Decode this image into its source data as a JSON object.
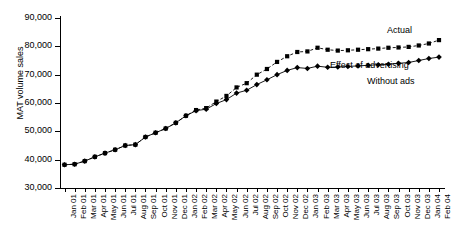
{
  "chart_data": {
    "type": "line",
    "title": "",
    "xlabel": "",
    "ylabel": "MAT volume sales",
    "ylim": [
      30000,
      90000
    ],
    "ytick_labels": [
      "30,000",
      "40,000",
      "50,000",
      "60,000",
      "70,000",
      "80,000",
      "90,000"
    ],
    "ytick_values": [
      30000,
      40000,
      50000,
      60000,
      70000,
      80000,
      90000
    ],
    "grid": false,
    "legend_position": "inline-annotations",
    "categories": [
      "Jan 01",
      "Feb 01",
      "Mar 01",
      "Apr 01",
      "May 01",
      "Jun 01",
      "Jul 01",
      "Aug 01",
      "Sep 01",
      "Oct 01",
      "Nov 01",
      "Dec 01",
      "Jan 02",
      "Feb 02",
      "Mar 02",
      "Apr 02",
      "May 02",
      "Jun 02",
      "Jul 02",
      "Aug 02",
      "Sep 02",
      "Oct 02",
      "Nov 02",
      "Dec 02",
      "Jan 03",
      "Feb 03",
      "Mar 03",
      "Apr 03",
      "May 03",
      "Jun 03",
      "Jul 03",
      "Aug 03",
      "Sep 03",
      "Oct 03",
      "Nov 03",
      "Dec 03",
      "Jan 04",
      "Feb 04"
    ],
    "series": [
      {
        "name": "Actual",
        "marker": "square",
        "line_style": "dashed",
        "color": "#000000",
        "values": [
          38200,
          38400,
          39500,
          41000,
          42300,
          43500,
          45000,
          45300,
          48000,
          49500,
          51000,
          53000,
          55500,
          57500,
          58200,
          60500,
          62500,
          65500,
          67000,
          70000,
          72000,
          74500,
          76500,
          78000,
          78200,
          79500,
          78800,
          78500,
          78600,
          78800,
          79000,
          79200,
          79500,
          79600,
          79800,
          80300,
          81000,
          82200
        ]
      },
      {
        "name": "Without ads",
        "marker": "diamond",
        "line_style": "solid",
        "color": "#000000",
        "values": [
          38200,
          38400,
          39500,
          41000,
          42300,
          43500,
          45000,
          45300,
          48000,
          49500,
          51000,
          53000,
          55500,
          57300,
          57800,
          59800,
          61200,
          63500,
          64500,
          66500,
          68200,
          70000,
          71500,
          72500,
          72200,
          73000,
          72600,
          72700,
          72900,
          73100,
          73300,
          73500,
          73700,
          74000,
          74300,
          75000,
          75700,
          76200
        ]
      }
    ],
    "annotations": [
      {
        "id": "actual",
        "text": "Actual"
      },
      {
        "id": "effect",
        "text": "Effect of advertising"
      },
      {
        "id": "without",
        "text": "Without ads"
      }
    ]
  }
}
